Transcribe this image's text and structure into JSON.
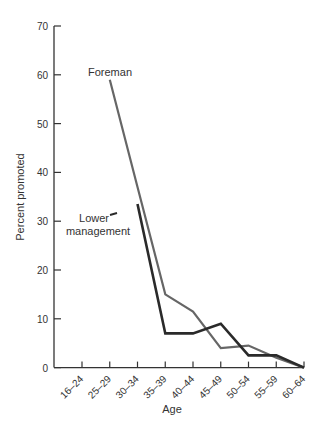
{
  "chart_data": {
    "type": "line",
    "title": "",
    "xlabel": "Age",
    "ylabel": "Percent promoted",
    "ylim": [
      0,
      70
    ],
    "yticks": [
      0,
      10,
      20,
      30,
      40,
      50,
      60,
      70
    ],
    "grid": false,
    "legend": "inline annotations",
    "categories": [
      "16–24",
      "25–29",
      "30–34",
      "35–39",
      "40–44",
      "45–49",
      "50–54",
      "55–59",
      "60–64"
    ],
    "series": [
      {
        "name": "Foreman",
        "color": "#666666",
        "values": [
          null,
          59,
          37,
          15,
          11.5,
          4,
          4.5,
          2,
          0
        ]
      },
      {
        "name": "Lower management",
        "color": "#2a2a2a",
        "values": [
          null,
          null,
          33.5,
          7,
          7,
          9,
          2.5,
          2.5,
          0
        ]
      }
    ],
    "annotations": [
      {
        "text": "Foreman",
        "series": "Foreman"
      },
      {
        "text": "Lower management",
        "lines": [
          "Lower",
          "management"
        ],
        "series": "Lower management"
      }
    ]
  }
}
